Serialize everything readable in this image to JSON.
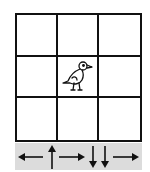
{
  "grid": {
    "rows": 3,
    "cols": 3,
    "agent": {
      "row": 1,
      "col": 1,
      "icon": "bird-icon"
    }
  },
  "action_sequence": [
    {
      "direction": "left",
      "icon": "arrow-left-icon"
    },
    {
      "direction": "up",
      "icon": "arrow-up-icon"
    },
    {
      "direction": "right",
      "icon": "arrow-right-icon"
    },
    {
      "direction": "down",
      "icon": "arrow-down-icon"
    },
    {
      "direction": "down",
      "icon": "arrow-down-icon"
    },
    {
      "direction": "right",
      "icon": "arrow-right-icon"
    }
  ],
  "colors": {
    "line": "#111111",
    "bar_bg": "#dcdcdc"
  }
}
